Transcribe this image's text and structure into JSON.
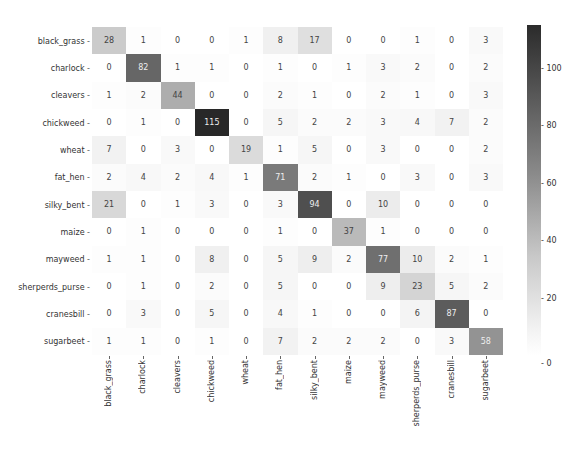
{
  "chart_data": {
    "type": "heatmap",
    "title": "",
    "xlabel": "",
    "ylabel": "",
    "row_labels": [
      "black_grass",
      "charlock",
      "cleavers",
      "chickweed",
      "wheat",
      "fat_hen",
      "silky_bent",
      "maize",
      "mayweed",
      "sherperds_purse",
      "cranesbill",
      "sugarbeet"
    ],
    "col_labels": [
      "black_grass",
      "charlock",
      "cleavers",
      "chickweed",
      "wheat",
      "fat_hen",
      "silky_bent",
      "maize",
      "mayweed",
      "sherperds_purse",
      "cranesbill",
      "sugarbeet"
    ],
    "values": [
      [
        28,
        1,
        0,
        0,
        1,
        8,
        17,
        0,
        0,
        1,
        0,
        3
      ],
      [
        0,
        82,
        1,
        1,
        0,
        1,
        0,
        1,
        3,
        2,
        0,
        2
      ],
      [
        1,
        2,
        44,
        0,
        0,
        2,
        1,
        0,
        2,
        1,
        0,
        3
      ],
      [
        0,
        1,
        0,
        115,
        0,
        5,
        2,
        2,
        3,
        4,
        7,
        2
      ],
      [
        7,
        0,
        3,
        0,
        19,
        1,
        5,
        0,
        3,
        0,
        0,
        2
      ],
      [
        2,
        4,
        2,
        4,
        1,
        71,
        2,
        1,
        0,
        3,
        0,
        3
      ],
      [
        21,
        0,
        1,
        3,
        0,
        3,
        94,
        0,
        10,
        0,
        0,
        0
      ],
      [
        0,
        1,
        0,
        0,
        0,
        1,
        0,
        37,
        1,
        0,
        0,
        0
      ],
      [
        1,
        1,
        0,
        8,
        0,
        5,
        9,
        2,
        77,
        10,
        2,
        1
      ],
      [
        0,
        1,
        0,
        2,
        0,
        5,
        0,
        0,
        9,
        23,
        5,
        2
      ],
      [
        0,
        3,
        0,
        5,
        0,
        4,
        1,
        0,
        0,
        6,
        87,
        0
      ],
      [
        1,
        1,
        0,
        1,
        0,
        7,
        2,
        2,
        2,
        0,
        3,
        58
      ]
    ],
    "colorbar": {
      "ticks": [
        0,
        20,
        40,
        60,
        80,
        100
      ],
      "range": [
        0,
        115
      ],
      "colormap": "greys"
    },
    "annotated": true
  }
}
